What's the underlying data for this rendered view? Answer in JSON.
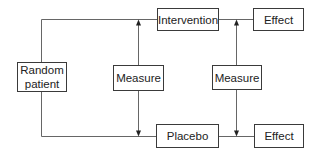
{
  "diagram": {
    "type": "flowchart",
    "nodes": {
      "random_patient": {
        "line1": "Random",
        "line2": "patient"
      },
      "intervention": {
        "label": "Intervention"
      },
      "effect_top": {
        "label": "Effect"
      },
      "measure_left": {
        "label": "Measure"
      },
      "measure_right": {
        "label": "Measure"
      },
      "placebo": {
        "label": "Placebo"
      },
      "effect_bottom": {
        "label": "Effect"
      }
    },
    "edges": [
      {
        "from": "random_patient",
        "to": "intervention"
      },
      {
        "from": "random_patient",
        "to": "placebo"
      },
      {
        "from": "intervention",
        "to": "effect_top"
      },
      {
        "from": "placebo",
        "to": "effect_bottom"
      },
      {
        "from": "measure_left",
        "to": "intervention-link",
        "arrow": "up"
      },
      {
        "from": "measure_left",
        "to": "placebo-link",
        "arrow": "down"
      },
      {
        "from": "measure_right",
        "to": "effect_top-link",
        "arrow": "up"
      },
      {
        "from": "measure_right",
        "to": "effect_bottom-link",
        "arrow": "down"
      }
    ],
    "colors": {
      "line": "#555555",
      "border": "#3a3a3a",
      "text": "#222222"
    }
  }
}
